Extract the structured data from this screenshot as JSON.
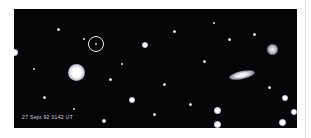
{
  "figure": {
    "kind": "astronomical-ccd-image",
    "media": "negative-print photograph of a star field",
    "background_color": "#050507",
    "page_color": "#ffffff",
    "marker_color": "#f2f2f2",
    "star_color": "#ffffff"
  },
  "plate": {
    "timestamp_label": "27 Sept 92 0142 UT",
    "marker": {
      "name": "circled-object",
      "shape": "circle",
      "center_x": 82,
      "center_y": 35,
      "radius": 8
    }
  },
  "objects": [
    {
      "name": "bright-star-left",
      "x": 62,
      "y": 63,
      "size": 17,
      "kind": "star"
    },
    {
      "name": "edge-on-galaxy",
      "x": 228,
      "y": 66,
      "w": 26,
      "h": 8,
      "kind": "galaxy"
    },
    {
      "name": "bright-blob-upper-right",
      "x": 258,
      "y": 40,
      "size": 11,
      "kind": "fuzz"
    },
    {
      "name": "star-left-edge",
      "x": 0,
      "y": 43,
      "size": 7,
      "kind": "star"
    },
    {
      "name": "star-mid-upper",
      "x": 131,
      "y": 36,
      "size": 6,
      "kind": "star"
    },
    {
      "name": "star-lower-mid",
      "x": 118,
      "y": 91,
      "size": 6,
      "kind": "star"
    },
    {
      "name": "star-right-mid",
      "x": 271,
      "y": 89,
      "size": 6,
      "kind": "star"
    },
    {
      "name": "star-lower-right-a",
      "x": 203,
      "y": 101,
      "size": 7,
      "kind": "star"
    },
    {
      "name": "star-lower-right-b",
      "x": 203,
      "y": 115,
      "size": 7,
      "kind": "star"
    },
    {
      "name": "star-bottom-right",
      "x": 268,
      "y": 113,
      "size": 7,
      "kind": "star"
    },
    {
      "name": "star-corner-right",
      "x": 280,
      "y": 103,
      "size": 6,
      "kind": "star"
    },
    {
      "name": "star-bottom-edge",
      "x": 90,
      "y": 112,
      "size": 4,
      "kind": "star"
    },
    {
      "name": "faint-star-a",
      "x": 44,
      "y": 20,
      "size": 3,
      "kind": "star"
    },
    {
      "name": "faint-star-b",
      "x": 160,
      "y": 22,
      "size": 3,
      "kind": "star"
    },
    {
      "name": "faint-star-c",
      "x": 190,
      "y": 52,
      "size": 3,
      "kind": "star"
    },
    {
      "name": "faint-star-d",
      "x": 96,
      "y": 70,
      "size": 3,
      "kind": "star"
    },
    {
      "name": "faint-star-e",
      "x": 240,
      "y": 25,
      "size": 3,
      "kind": "star"
    },
    {
      "name": "faint-star-f",
      "x": 30,
      "y": 88,
      "size": 3,
      "kind": "star"
    },
    {
      "name": "faint-star-g",
      "x": 150,
      "y": 75,
      "size": 3,
      "kind": "star"
    },
    {
      "name": "faint-star-h",
      "x": 215,
      "y": 30,
      "size": 3,
      "kind": "star"
    },
    {
      "name": "faint-star-i",
      "x": 70,
      "y": 30,
      "size": 2,
      "kind": "star"
    },
    {
      "name": "faint-star-j",
      "x": 255,
      "y": 78,
      "size": 3,
      "kind": "star"
    },
    {
      "name": "faint-star-k",
      "x": 176,
      "y": 95,
      "size": 3,
      "kind": "star"
    },
    {
      "name": "faint-star-l",
      "x": 108,
      "y": 55,
      "size": 2,
      "kind": "star"
    },
    {
      "name": "faint-star-m",
      "x": 140,
      "y": 105,
      "size": 3,
      "kind": "star"
    },
    {
      "name": "faint-star-n",
      "x": 20,
      "y": 60,
      "size": 2,
      "kind": "star"
    },
    {
      "name": "faint-star-o",
      "x": 200,
      "y": 14,
      "size": 2,
      "kind": "star"
    },
    {
      "name": "faint-star-p",
      "x": 60,
      "y": 100,
      "size": 2,
      "kind": "star"
    }
  ]
}
